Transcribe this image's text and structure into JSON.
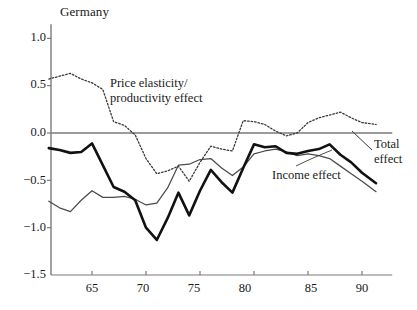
{
  "chart_data": {
    "type": "line",
    "title": "Germany",
    "xlabel": "",
    "ylabel": "",
    "xlim": [
      61,
      92.8
    ],
    "ylim": [
      -1.5,
      1.15
    ],
    "grid": false,
    "legend_position": "inline-annotations",
    "zero_line": 0.0,
    "yticks": [
      1.0,
      0.5,
      0.0,
      -0.5,
      -1.0,
      -1.5
    ],
    "ytick_labels": [
      "1.0",
      "0.5",
      "0.0",
      "−0.5",
      "−1.0",
      "−1.5"
    ],
    "xticks": [
      65,
      70,
      75,
      80,
      85,
      90
    ],
    "xtick_labels": [
      "65",
      "70",
      "75",
      "80",
      "85",
      "90"
    ],
    "annotations": [
      {
        "name": "price-elasticity-label",
        "text_line1": "Price elasticity/",
        "text_line2": "productivity effect"
      },
      {
        "name": "income-effect-label",
        "text": "Income effect"
      },
      {
        "name": "total-effect-label",
        "text_line1": "Total",
        "text_line2": "effect"
      }
    ],
    "x": [
      61,
      62,
      63,
      64,
      65,
      66,
      67,
      68,
      69,
      70,
      71,
      72,
      73,
      74,
      75,
      76,
      77,
      78,
      79,
      80,
      81,
      82,
      83,
      84,
      85,
      86,
      87,
      88,
      89,
      90,
      91.3
    ],
    "series": [
      {
        "name": "Price elasticity/productivity effect",
        "style": "dotted",
        "color": "#3a3a3a",
        "values": [
          0.57,
          0.6,
          0.63,
          0.57,
          0.53,
          0.46,
          0.12,
          0.08,
          -0.02,
          -0.27,
          -0.43,
          -0.4,
          -0.35,
          -0.51,
          -0.31,
          -0.14,
          -0.17,
          -0.19,
          0.13,
          0.12,
          0.09,
          0.02,
          -0.03,
          0.0,
          0.11,
          0.16,
          0.19,
          0.22,
          0.16,
          0.11,
          0.09
        ]
      },
      {
        "name": "Income effect",
        "style": "thin-solid",
        "color": "#4a4a4a",
        "values": [
          -0.72,
          -0.79,
          -0.83,
          -0.71,
          -0.61,
          -0.68,
          -0.68,
          -0.67,
          -0.7,
          -0.76,
          -0.74,
          -0.58,
          -0.34,
          -0.33,
          -0.28,
          -0.27,
          -0.37,
          -0.45,
          -0.36,
          -0.22,
          -0.19,
          -0.17,
          -0.2,
          -0.24,
          -0.22,
          -0.24,
          -0.27,
          -0.35,
          -0.43,
          -0.51,
          -0.62
        ]
      },
      {
        "name": "Total effect",
        "style": "thick-solid",
        "color": "#111111",
        "values": [
          -0.16,
          -0.18,
          -0.21,
          -0.2,
          -0.11,
          -0.34,
          -0.57,
          -0.62,
          -0.71,
          -1.0,
          -1.13,
          -0.9,
          -0.63,
          -0.87,
          -0.61,
          -0.39,
          -0.52,
          -0.63,
          -0.37,
          -0.12,
          -0.15,
          -0.14,
          -0.21,
          -0.22,
          -0.19,
          -0.17,
          -0.12,
          -0.23,
          -0.31,
          -0.42,
          -0.53
        ]
      }
    ]
  },
  "axis_color": "#7a7a7a",
  "zero_line_color": "#7a7a7a"
}
